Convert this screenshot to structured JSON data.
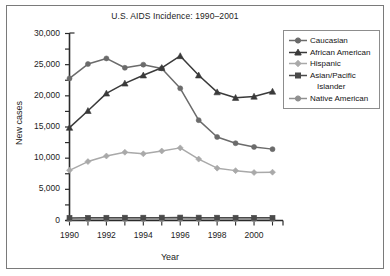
{
  "chart_data": {
    "type": "line",
    "title": "U.S. AIDS Incidence: 1990–2001",
    "xlabel": "Year",
    "ylabel": "New cases",
    "grid": false,
    "legend_position": "right",
    "xlim": [
      1990,
      2001
    ],
    "ylim": [
      0,
      30000
    ],
    "x": [
      1990,
      1991,
      1992,
      1993,
      1994,
      1995,
      1996,
      1997,
      1998,
      1999,
      2000,
      2001
    ],
    "xtick_labels": [
      "1990",
      "1992",
      "1994",
      "1996",
      "1998",
      "2000"
    ],
    "xticks": [
      1990,
      1992,
      1994,
      1996,
      1998,
      2000
    ],
    "ytick_labels": [
      "0",
      "5,000",
      "10,000",
      "15,000",
      "20,000",
      "25,000",
      "30,000"
    ],
    "yticks": [
      0,
      5000,
      10000,
      15000,
      20000,
      25000,
      30000
    ],
    "series": [
      {
        "name": "Caucasian",
        "marker": "circle",
        "color": "#6b6b6b",
        "values": [
          22800,
          25100,
          26000,
          24500,
          25000,
          24400,
          21200,
          16100,
          13400,
          12400,
          11800,
          11450
        ]
      },
      {
        "name": "African American",
        "marker": "triangle",
        "color": "#3a3a3a",
        "values": [
          14900,
          17600,
          20400,
          22000,
          23300,
          24500,
          26400,
          23300,
          20600,
          19700,
          19900,
          20700
        ]
      },
      {
        "name": "Hispanic",
        "marker": "diamond",
        "color": "#a9a9a9",
        "values": [
          8050,
          9450,
          10350,
          10950,
          10700,
          11150,
          11650,
          9850,
          8400,
          8000,
          7700,
          7750
        ]
      },
      {
        "name": "Asian/Pacific Islander",
        "marker": "square",
        "color": "#4a4a4a",
        "values": [
          420,
          430,
          440,
          450,
          450,
          460,
          470,
          460,
          450,
          440,
          430,
          430
        ]
      },
      {
        "name": "Native American",
        "marker": "circle",
        "color": "#909090",
        "values": [
          180,
          190,
          200,
          210,
          215,
          220,
          225,
          220,
          215,
          210,
          205,
          205
        ]
      }
    ]
  },
  "legend": {
    "entries": [
      {
        "label": "Caucasian",
        "cont": ""
      },
      {
        "label": "African American",
        "cont": ""
      },
      {
        "label": "Hispanic",
        "cont": ""
      },
      {
        "label": "Asian/Pacific",
        "cont": "Islander"
      },
      {
        "label": "Native American",
        "cont": ""
      }
    ]
  }
}
